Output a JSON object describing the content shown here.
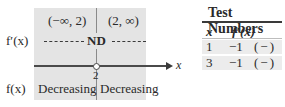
{
  "diagram": {
    "intervals": [
      "(−∞, 2)",
      "(2, ∞)"
    ],
    "derivative_label": "f′(x)",
    "derivative_value_at_break": "ND",
    "function_label": "f(x)",
    "behavior": [
      "Decreasing",
      "Decreasing"
    ],
    "break_point": "2",
    "axis_label": "x",
    "colors": {
      "panel": "#e4e4e4",
      "line": "#4a4a4a"
    }
  },
  "table": {
    "title": "Test Numbers",
    "headers": [
      "x",
      "f′(x)"
    ],
    "rows": [
      {
        "x": "1",
        "value": "−1",
        "sign": "(−)"
      },
      {
        "x": "3",
        "value": "−1",
        "sign": "(−)"
      }
    ]
  }
}
